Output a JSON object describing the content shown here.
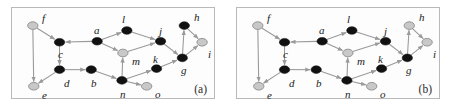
{
  "figure": {
    "type": "diagram",
    "panels": [
      {
        "id": "a",
        "caption": "(a)",
        "nodes": [
          {
            "id": "f",
            "label": "f",
            "x": 21,
            "y": 18,
            "fill": "gray",
            "label_dx": 9,
            "label_dy": -13
          },
          {
            "id": "c",
            "label": "c",
            "x": 48,
            "y": 35,
            "fill": "black",
            "label_dx": -2,
            "label_dy": 6
          },
          {
            "id": "a",
            "label": "a",
            "x": 86,
            "y": 34,
            "fill": "black",
            "label_dx": -4,
            "label_dy": -17
          },
          {
            "id": "l",
            "label": "l",
            "x": 116,
            "y": 23,
            "fill": "black",
            "label_dx": -6,
            "label_dy": -17
          },
          {
            "id": "j",
            "label": "j",
            "x": 150,
            "y": 34,
            "fill": "black",
            "label_dx": -3,
            "label_dy": -16
          },
          {
            "id": "h",
            "label": "h",
            "x": 174,
            "y": 18,
            "fill": "black",
            "label_dx": 8,
            "label_dy": -14
          },
          {
            "id": "i",
            "label": "i",
            "x": 192,
            "y": 35,
            "fill": "gray",
            "label_dx": 4,
            "label_dy": 6
          },
          {
            "id": "m",
            "label": "m",
            "x": 112,
            "y": 46,
            "fill": "gray",
            "label_dx": 8,
            "label_dy": 2
          },
          {
            "id": "g",
            "label": "g",
            "x": 172,
            "y": 51,
            "fill": "black",
            "label_dx": -3,
            "label_dy": 6
          },
          {
            "id": "k",
            "label": "k",
            "x": 146,
            "y": 62,
            "fill": "black",
            "label_dx": -5,
            "label_dy": -16
          },
          {
            "id": "d",
            "label": "d",
            "x": 48,
            "y": 63,
            "fill": "black",
            "label_dx": 4,
            "label_dy": 7
          },
          {
            "id": "b",
            "label": "b",
            "x": 80,
            "y": 63,
            "fill": "black",
            "label_dx": -1,
            "label_dy": 7
          },
          {
            "id": "n",
            "label": "n",
            "x": 111,
            "y": 74,
            "fill": "black",
            "label_dx": -3,
            "label_dy": 7
          },
          {
            "id": "o",
            "label": "o",
            "x": 136,
            "y": 80,
            "fill": "gray",
            "label_dx": 7,
            "label_dy": 1
          },
          {
            "id": "e",
            "label": "e",
            "x": 22,
            "y": 80,
            "fill": "gray",
            "label_dx": 8,
            "label_dy": 2
          }
        ],
        "edges": [
          {
            "from": "f",
            "to": "c"
          },
          {
            "from": "f",
            "to": "e"
          },
          {
            "from": "a",
            "to": "c"
          },
          {
            "from": "c",
            "to": "d"
          },
          {
            "from": "d",
            "to": "b"
          },
          {
            "from": "d",
            "to": "e"
          },
          {
            "from": "a",
            "to": "l"
          },
          {
            "from": "a",
            "to": "m"
          },
          {
            "from": "l",
            "to": "j"
          },
          {
            "from": "m",
            "to": "j"
          },
          {
            "from": "n",
            "to": "m"
          },
          {
            "from": "j",
            "to": "g"
          },
          {
            "from": "h",
            "to": "i"
          },
          {
            "from": "g",
            "to": "h"
          },
          {
            "from": "g",
            "to": "i"
          },
          {
            "from": "k",
            "to": "g"
          },
          {
            "from": "n",
            "to": "k"
          },
          {
            "from": "n",
            "to": "o"
          },
          {
            "from": "b",
            "to": "n"
          }
        ]
      },
      {
        "id": "b",
        "caption": "(b)",
        "nodes": [
          {
            "id": "f",
            "label": "f",
            "x": 21,
            "y": 18,
            "fill": "gray",
            "label_dx": 9,
            "label_dy": -13
          },
          {
            "id": "c",
            "label": "c",
            "x": 48,
            "y": 35,
            "fill": "black",
            "label_dx": -2,
            "label_dy": 6
          },
          {
            "id": "a",
            "label": "a",
            "x": 86,
            "y": 34,
            "fill": "black",
            "label_dx": -4,
            "label_dy": -17
          },
          {
            "id": "l",
            "label": "l",
            "x": 116,
            "y": 23,
            "fill": "black",
            "label_dx": -6,
            "label_dy": -17
          },
          {
            "id": "j",
            "label": "j",
            "x": 150,
            "y": 34,
            "fill": "black",
            "label_dx": -3,
            "label_dy": -16
          },
          {
            "id": "h",
            "label": "h",
            "x": 174,
            "y": 18,
            "fill": "gray",
            "label_dx": 8,
            "label_dy": -14
          },
          {
            "id": "i",
            "label": "i",
            "x": 192,
            "y": 35,
            "fill": "gray",
            "label_dx": 4,
            "label_dy": 6
          },
          {
            "id": "m",
            "label": "m",
            "x": 112,
            "y": 46,
            "fill": "gray",
            "label_dx": 8,
            "label_dy": 2
          },
          {
            "id": "g",
            "label": "g",
            "x": 172,
            "y": 51,
            "fill": "black",
            "label_dx": -3,
            "label_dy": 6
          },
          {
            "id": "k",
            "label": "k",
            "x": 146,
            "y": 62,
            "fill": "black",
            "label_dx": -5,
            "label_dy": -16
          },
          {
            "id": "d",
            "label": "d",
            "x": 48,
            "y": 63,
            "fill": "black",
            "label_dx": 4,
            "label_dy": 7
          },
          {
            "id": "b",
            "label": "b",
            "x": 80,
            "y": 63,
            "fill": "black",
            "label_dx": -1,
            "label_dy": 7
          },
          {
            "id": "n",
            "label": "n",
            "x": 111,
            "y": 74,
            "fill": "black",
            "label_dx": -3,
            "label_dy": 7
          },
          {
            "id": "o",
            "label": "o",
            "x": 136,
            "y": 80,
            "fill": "gray",
            "label_dx": 7,
            "label_dy": 1
          },
          {
            "id": "e",
            "label": "e",
            "x": 22,
            "y": 80,
            "fill": "gray",
            "label_dx": 8,
            "label_dy": 2
          }
        ],
        "edges": [
          {
            "from": "f",
            "to": "c"
          },
          {
            "from": "f",
            "to": "e"
          },
          {
            "from": "a",
            "to": "c"
          },
          {
            "from": "c",
            "to": "d"
          },
          {
            "from": "d",
            "to": "b"
          },
          {
            "from": "d",
            "to": "e"
          },
          {
            "from": "a",
            "to": "l"
          },
          {
            "from": "a",
            "to": "m"
          },
          {
            "from": "l",
            "to": "j"
          },
          {
            "from": "m",
            "to": "j"
          },
          {
            "from": "n",
            "to": "m"
          },
          {
            "from": "j",
            "to": "g"
          },
          {
            "from": "h",
            "to": "i"
          },
          {
            "from": "g",
            "to": "h"
          },
          {
            "from": "g",
            "to": "i"
          },
          {
            "from": "k",
            "to": "g"
          },
          {
            "from": "n",
            "to": "k"
          },
          {
            "from": "n",
            "to": "o"
          },
          {
            "from": "b",
            "to": "n"
          }
        ]
      }
    ],
    "colors": {
      "node_black": "#111111",
      "node_gray": "#c8c8c8",
      "node_gray_stroke": "#8a8a8a",
      "edge": "#9a9a9a",
      "label": "#1a1a1a",
      "panel_border": "#b9b9b9",
      "background": "#ffffff"
    },
    "node_radius_x": 5.2,
    "node_radius_y": 3.9
  }
}
